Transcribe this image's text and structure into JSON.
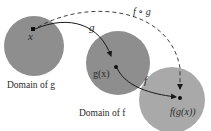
{
  "diagram": {
    "colors": {
      "domain_g_fill": "#8e8e8e",
      "domain_f_fill": "#8e8e8e",
      "range_fill": "#a9a9a9",
      "arrow": "#1a1a1a",
      "text": "#2a2a2a"
    },
    "nodes": [
      {
        "id": "x",
        "label": "x"
      },
      {
        "id": "gx",
        "label": "g(x)"
      },
      {
        "id": "fgx",
        "label": "f(g(x))"
      }
    ],
    "regions": [
      {
        "id": "domain_g",
        "label": "Domain of g"
      },
      {
        "id": "domain_f",
        "label": "Domain of f"
      },
      {
        "id": "codomain",
        "label": ""
      }
    ],
    "arrows": [
      {
        "from": "x",
        "to": "gx",
        "label": "g",
        "style": "solid"
      },
      {
        "from": "gx",
        "to": "fgx",
        "label": "f",
        "style": "solid"
      },
      {
        "from": "x",
        "to": "fgx",
        "label": "f ∘ g",
        "style": "dashed"
      }
    ]
  }
}
